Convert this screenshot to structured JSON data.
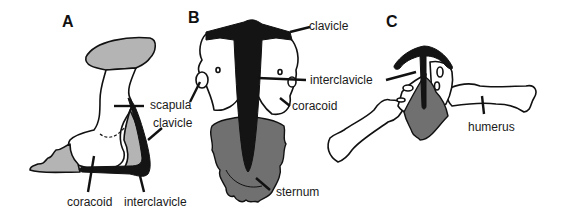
{
  "figure": {
    "panels": [
      {
        "id": "A",
        "label": "A",
        "labels": {
          "scapula": "scapula",
          "clavicle": "clavicle",
          "coracoid": "coracoid",
          "interclavicle": "interclavicle"
        }
      },
      {
        "id": "B",
        "label": "B",
        "labels": {
          "clavicle": "clavicle",
          "interclavicle": "interclavicle",
          "coracoid": "coracoid",
          "sternum": "sternum"
        }
      },
      {
        "id": "C",
        "label": "C",
        "labels": {
          "humerus": "humerus"
        }
      }
    ],
    "colors": {
      "light_gray": "#b4b4b4",
      "dark_gray": "#707070",
      "black": "#141414",
      "outline": "#111111"
    }
  }
}
